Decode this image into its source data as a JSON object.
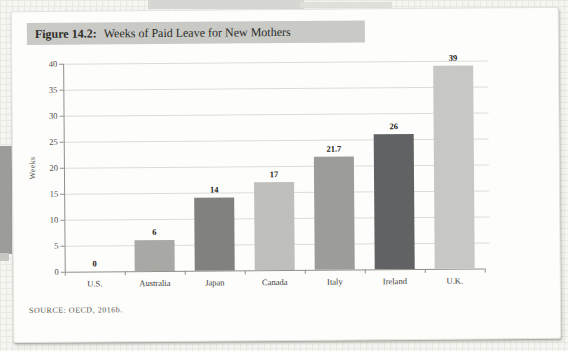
{
  "figure": {
    "label": "Figure 14.2:",
    "title": "Weeks of Paid Leave for New Mothers",
    "source": "SOURCE: OECD, 2016b."
  },
  "chart_data": {
    "type": "bar",
    "title": "Weeks of Paid Leave for New Mothers",
    "ylabel": "Weeks",
    "xlabel": "",
    "categories": [
      "U.S.",
      "Australia",
      "Japan",
      "Canada",
      "Italy",
      "Ireland",
      "U.K."
    ],
    "values": [
      0,
      6,
      14,
      17,
      21.7,
      26,
      39
    ],
    "value_labels": [
      "0",
      "6",
      "14",
      "17",
      "21.7",
      "26",
      "39"
    ],
    "bar_colors": [
      null,
      "#a8a9a5",
      "#81827e",
      "#bfc0bc",
      "#9c9d99",
      "#616263",
      "#c7c8c4"
    ],
    "yticks": [
      0,
      5,
      10,
      15,
      20,
      25,
      30,
      35,
      40
    ],
    "ylim": [
      0,
      40
    ],
    "grid": true,
    "legend": false
  },
  "colors": {
    "title_highlight": "#c9cac6",
    "gridline": "#dcdcd7",
    "axis": "#8f8f8b",
    "card_background": "#fdfdfb"
  }
}
